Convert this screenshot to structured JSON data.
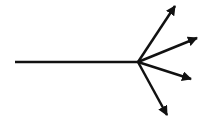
{
  "diagram": {
    "type": "branching-arrows",
    "background": "#ffffff",
    "stroke_color": "#111111",
    "stroke_width": 2.5,
    "stem": {
      "x1": 15,
      "y1": 62,
      "x2": 138,
      "y2": 62
    },
    "hub": {
      "x": 138,
      "y": 62
    },
    "arrows": [
      {
        "name": "arrow-up-right-steep",
        "x2": 175,
        "y2": 6
      },
      {
        "name": "arrow-up-right-shallow",
        "x2": 197,
        "y2": 38
      },
      {
        "name": "arrow-down-right-shallow",
        "x2": 191,
        "y2": 79
      },
      {
        "name": "arrow-down-right-steep",
        "x2": 167,
        "y2": 115
      }
    ]
  }
}
